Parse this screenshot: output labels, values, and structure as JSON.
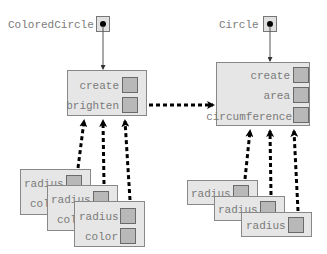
{
  "diagram": {
    "left": {
      "variable_label": "ColoredCircle",
      "methods": [
        "create",
        "brighten"
      ],
      "instances": [
        {
          "fields": [
            "radius",
            "color"
          ]
        },
        {
          "fields": [
            "radius",
            "color"
          ]
        },
        {
          "fields": [
            "radius",
            "color"
          ]
        }
      ]
    },
    "right": {
      "variable_label": "Circle",
      "methods": [
        "create",
        "area",
        "circumference"
      ],
      "instances": [
        {
          "fields": [
            "radius"
          ]
        },
        {
          "fields": [
            "radius"
          ]
        },
        {
          "fields": [
            "radius"
          ]
        }
      ]
    },
    "colors": {
      "box_fill": "#e6e6e6",
      "slot_fill": "#b8b8b8",
      "text": "#7a7a7a",
      "arrow": "#000000"
    }
  }
}
